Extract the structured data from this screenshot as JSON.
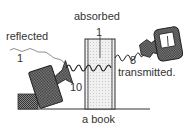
{
  "diagram": {
    "labels": {
      "absorbed": "absorbed",
      "absorbed_value": "1",
      "reflected": "reflected",
      "reflected_value": "1",
      "incident_value": "10",
      "transmitted": "transmitted.",
      "transmitted_value": "8",
      "book": "a book"
    },
    "icons": {
      "source": "speaker-icon",
      "receiver": "meter-microphone-icon"
    },
    "colors": {
      "line": "#333333",
      "hatch": "#555555",
      "book_fill": "#eeeeee"
    }
  }
}
